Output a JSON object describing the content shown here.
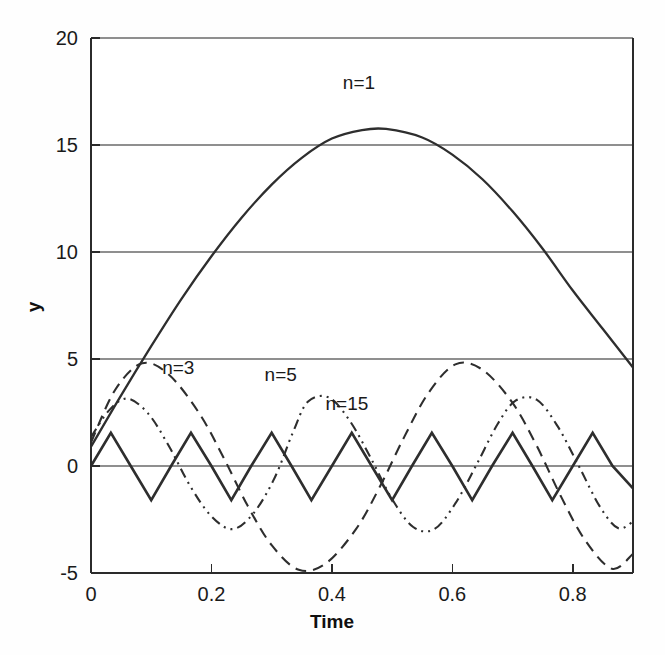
{
  "figure": {
    "background_color": "#fefefe",
    "plot_background_color": "#ffffff",
    "axis_color": "#2b2b2b",
    "grid_color": "#8f8f8f",
    "curve_color": "#2e2e2e"
  },
  "axes": {
    "x_title": "Time",
    "y_title": "y",
    "x_ticks": [
      "0",
      "0.2",
      "0.4",
      "0.6",
      "0.8"
    ],
    "y_ticks": [
      "20",
      "15",
      "10",
      "5",
      "0",
      "-5"
    ]
  },
  "labels": {
    "n1": "n=1",
    "n3": "n=3",
    "n5": "n=5",
    "n15": "n=15"
  },
  "chart_data": {
    "type": "line",
    "title": "",
    "xlabel": "Time",
    "ylabel": "y",
    "xlim": [
      0,
      0.9
    ],
    "ylim": [
      -5,
      20
    ],
    "xticks": [
      0,
      0.2,
      0.4,
      0.6,
      0.8
    ],
    "yticks": [
      -5,
      0,
      5,
      10,
      15,
      20
    ],
    "grid": true,
    "grid_axis": "y",
    "legend": "inline-annotations",
    "series": [
      {
        "name": "n=1",
        "label": "n=1",
        "linestyle": "solid",
        "color": "#2e2e2e",
        "waveform": "sine-half-arch",
        "amplitude": 15.75,
        "period": 1.8,
        "phase": 0.0,
        "offset": 0.0,
        "start_value": 0.9,
        "peak": {
          "x": 0.49,
          "y": 15.75
        },
        "end_value": 4.6,
        "label_position": {
          "x": 0.445,
          "y": 17.6
        },
        "description": "Large smooth arch rising from ~1 at t=0 to peak 15.75 near t=0.49, falling to ~4.6 at t=0.9",
        "points": [
          {
            "x": 0.0,
            "y": 0.9
          },
          {
            "x": 0.05,
            "y": 3.3
          },
          {
            "x": 0.1,
            "y": 5.6
          },
          {
            "x": 0.15,
            "y": 7.8
          },
          {
            "x": 0.2,
            "y": 9.8
          },
          {
            "x": 0.25,
            "y": 11.6
          },
          {
            "x": 0.3,
            "y": 13.15
          },
          {
            "x": 0.35,
            "y": 14.4
          },
          {
            "x": 0.4,
            "y": 15.3
          },
          {
            "x": 0.45,
            "y": 15.7
          },
          {
            "x": 0.49,
            "y": 15.75
          },
          {
            "x": 0.55,
            "y": 15.35
          },
          {
            "x": 0.6,
            "y": 14.55
          },
          {
            "x": 0.65,
            "y": 13.4
          },
          {
            "x": 0.7,
            "y": 11.9
          },
          {
            "x": 0.75,
            "y": 10.15
          },
          {
            "x": 0.8,
            "y": 8.2
          },
          {
            "x": 0.85,
            "y": 6.4
          },
          {
            "x": 0.9,
            "y": 4.6
          }
        ]
      },
      {
        "name": "n=3",
        "label": "n=3",
        "linestyle": "dashed",
        "color": "#2e2e2e",
        "waveform": "sine",
        "amplitude": 4.8,
        "period": 0.52,
        "peak": {
          "x": 0.085,
          "y": 4.8
        },
        "trough": {
          "x": 0.345,
          "y": -4.85
        },
        "label_position": {
          "x": 0.145,
          "y": 4.3
        },
        "description": "Dashed sinusoid, amplitude ~4.8, period ~0.52, peaks at t=0.085 and t=0.605",
        "points": [
          {
            "x": 0.0,
            "y": 1.1
          },
          {
            "x": 0.04,
            "y": 3.55
          },
          {
            "x": 0.085,
            "y": 4.8
          },
          {
            "x": 0.13,
            "y": 4.25
          },
          {
            "x": 0.18,
            "y": 2.45
          },
          {
            "x": 0.22,
            "y": 0.4
          },
          {
            "x": 0.26,
            "y": -1.85
          },
          {
            "x": 0.3,
            "y": -3.7
          },
          {
            "x": 0.345,
            "y": -4.85
          },
          {
            "x": 0.39,
            "y": -4.55
          },
          {
            "x": 0.44,
            "y": -2.95
          },
          {
            "x": 0.48,
            "y": -0.95
          },
          {
            "x": 0.52,
            "y": 1.35
          },
          {
            "x": 0.56,
            "y": 3.4
          },
          {
            "x": 0.605,
            "y": 4.75
          },
          {
            "x": 0.65,
            "y": 4.5
          },
          {
            "x": 0.7,
            "y": 2.95
          },
          {
            "x": 0.74,
            "y": 0.95
          },
          {
            "x": 0.78,
            "y": -1.4
          },
          {
            "x": 0.82,
            "y": -3.45
          },
          {
            "x": 0.865,
            "y": -4.8
          },
          {
            "x": 0.9,
            "y": -4.1
          }
        ]
      },
      {
        "name": "n=5",
        "label": "n=5",
        "linestyle": "dash-dot-dot",
        "color": "#2e2e2e",
        "amplitude": 3.25,
        "period": 0.41,
        "peak": {
          "x": 0.35,
          "y": 3.25
        },
        "trough": {
          "x": 0.155,
          "y": -2.3
        },
        "label_position": {
          "x": 0.315,
          "y": 3.95
        },
        "description": "Dash-dot-dot sinusoid, amplitude ~3.2, period ~0.41, peaks near t=0.145(partial), 0.35, 0.555, 0.76",
        "points": [
          {
            "x": 0.0,
            "y": 1.35
          },
          {
            "x": 0.03,
            "y": 2.6
          },
          {
            "x": 0.06,
            "y": 3.15
          },
          {
            "x": 0.095,
            "y": 2.45
          },
          {
            "x": 0.13,
            "y": 0.9
          },
          {
            "x": 0.165,
            "y": -0.95
          },
          {
            "x": 0.2,
            "y": -2.35
          },
          {
            "x": 0.235,
            "y": -2.95
          },
          {
            "x": 0.27,
            "y": -2.2
          },
          {
            "x": 0.305,
            "y": -0.55
          },
          {
            "x": 0.335,
            "y": 1.55
          },
          {
            "x": 0.36,
            "y": 3.0
          },
          {
            "x": 0.395,
            "y": 3.2
          },
          {
            "x": 0.43,
            "y": 2.1
          },
          {
            "x": 0.465,
            "y": 0.35
          },
          {
            "x": 0.5,
            "y": -1.55
          },
          {
            "x": 0.535,
            "y": -2.85
          },
          {
            "x": 0.57,
            "y": -2.95
          },
          {
            "x": 0.605,
            "y": -1.75
          },
          {
            "x": 0.64,
            "y": 0.05
          },
          {
            "x": 0.675,
            "y": 1.95
          },
          {
            "x": 0.705,
            "y": 3.05
          },
          {
            "x": 0.74,
            "y": 3.1
          },
          {
            "x": 0.775,
            "y": 1.85
          },
          {
            "x": 0.81,
            "y": 0.0
          },
          {
            "x": 0.845,
            "y": -1.9
          },
          {
            "x": 0.875,
            "y": -2.9
          },
          {
            "x": 0.9,
            "y": -2.6
          }
        ]
      },
      {
        "name": "n=15",
        "label": "n=15",
        "linestyle": "solid",
        "color": "#2e2e2e",
        "waveform": "triangle",
        "amplitude": 1.55,
        "period": 0.133,
        "start_value": 0.0,
        "label_position": {
          "x": 0.425,
          "y": 2.6
        },
        "description": "Solid triangular zigzag, amplitude ~1.55, period ~0.133, starting at 0 rising",
        "points": [
          {
            "x": 0.0,
            "y": 0.0
          },
          {
            "x": 0.033,
            "y": 1.55
          },
          {
            "x": 0.066,
            "y": 0.0
          },
          {
            "x": 0.1,
            "y": -1.6
          },
          {
            "x": 0.133,
            "y": 0.0
          },
          {
            "x": 0.166,
            "y": 1.55
          },
          {
            "x": 0.2,
            "y": 0.0
          },
          {
            "x": 0.233,
            "y": -1.6
          },
          {
            "x": 0.266,
            "y": 0.0
          },
          {
            "x": 0.3,
            "y": 1.55
          },
          {
            "x": 0.333,
            "y": 0.0
          },
          {
            "x": 0.366,
            "y": -1.6
          },
          {
            "x": 0.4,
            "y": 0.0
          },
          {
            "x": 0.433,
            "y": 1.55
          },
          {
            "x": 0.466,
            "y": 0.0
          },
          {
            "x": 0.5,
            "y": -1.6
          },
          {
            "x": 0.533,
            "y": 0.0
          },
          {
            "x": 0.566,
            "y": 1.55
          },
          {
            "x": 0.6,
            "y": 0.0
          },
          {
            "x": 0.633,
            "y": -1.6
          },
          {
            "x": 0.666,
            "y": 0.0
          },
          {
            "x": 0.7,
            "y": 1.55
          },
          {
            "x": 0.733,
            "y": 0.0
          },
          {
            "x": 0.766,
            "y": -1.6
          },
          {
            "x": 0.8,
            "y": 0.0
          },
          {
            "x": 0.833,
            "y": 1.55
          },
          {
            "x": 0.866,
            "y": 0.0
          },
          {
            "x": 0.9,
            "y": -1.05
          }
        ]
      }
    ]
  }
}
